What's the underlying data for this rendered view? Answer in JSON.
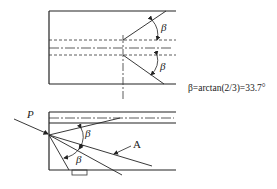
{
  "top_view": {
    "beta_upper": "β",
    "beta_lower": "β"
  },
  "formula": "β=arctan(2/3)=33.7°",
  "side_view": {
    "load_label": "P",
    "beta_upper": "β",
    "beta_lower": "β",
    "pointer_label": "A"
  },
  "caption": "",
  "colors": {
    "line": "#222222",
    "background": "#ffffff"
  }
}
